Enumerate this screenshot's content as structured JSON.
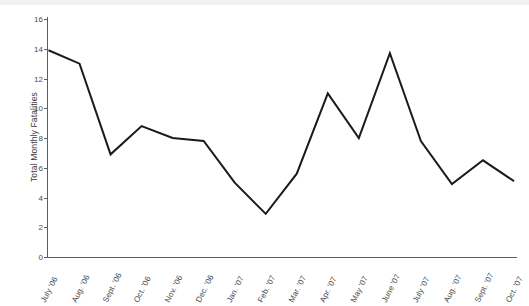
{
  "chart_data": {
    "type": "line",
    "title": "",
    "xlabel": "",
    "ylabel": "Total Monthly Fatalities",
    "ylim": [
      0,
      16
    ],
    "yticks": [
      0,
      2,
      4,
      6,
      8,
      10,
      12,
      14,
      16
    ],
    "grid": false,
    "legend": null,
    "line_color": "#1a1a1a",
    "axis_color": "#5d5d5d",
    "categories": [
      "July '06",
      "Aug. '06",
      "Sept. '06",
      "Oct. '06",
      "Nov. '06",
      "Dec. '06",
      "Jan. '07",
      "Feb. '07",
      "Mar. '07",
      "Apr. '07",
      "May '07",
      "June '07",
      "July '07",
      "Aug. '07",
      "Sept. '07",
      "Oct. '07"
    ],
    "values": [
      13.9,
      13.0,
      6.9,
      8.8,
      8.0,
      7.8,
      5.0,
      2.9,
      5.6,
      11.0,
      8.0,
      13.7,
      7.8,
      4.9,
      6.5,
      5.1
    ]
  }
}
